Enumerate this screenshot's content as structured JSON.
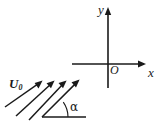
{
  "figure": {
    "kind": "flow-over-plate-coordinate-diagram",
    "background_color": "#ffffff",
    "stroke_color": "#1a1a1a",
    "width": 166,
    "height": 127
  },
  "labels": {
    "y_axis": "y",
    "x_axis": "x",
    "origin": "O",
    "velocity_symbol": "U",
    "velocity_subscript": "0",
    "angle": "α"
  },
  "axes": {
    "origin_px": [
      108,
      64
    ],
    "x_axis": {
      "from_px": [
        72,
        64
      ],
      "to_px": [
        146,
        64
      ],
      "arrow_at": "end",
      "label": "x"
    },
    "y_axis": {
      "from_px": [
        108,
        88
      ],
      "to_px": [
        108,
        8
      ],
      "arrow_at": "end",
      "label": "y"
    }
  },
  "flow_arrows": {
    "count": 4,
    "label": "U0",
    "direction_degrees_from_horizontal": 35,
    "lines": [
      {
        "from_px": [
          5,
          107
        ],
        "to_px": [
          42,
          81
        ]
      },
      {
        "from_px": [
          16,
          116
        ],
        "to_px": [
          54,
          81
        ]
      },
      {
        "from_px": [
          29,
          120
        ],
        "to_px": [
          66,
          81
        ]
      },
      {
        "from_px": [
          42,
          117
        ],
        "to_px": [
          79,
          80
        ]
      }
    ]
  },
  "reference_line": {
    "from_px": [
      42,
      117
    ],
    "to_px": [
      86,
      117
    ],
    "description": "horizontal baseline for angle alpha"
  },
  "angle_arc": {
    "center_px": [
      42,
      117
    ],
    "radius_px": 26,
    "start_degrees": 0,
    "end_degrees": 35,
    "label": "α"
  }
}
